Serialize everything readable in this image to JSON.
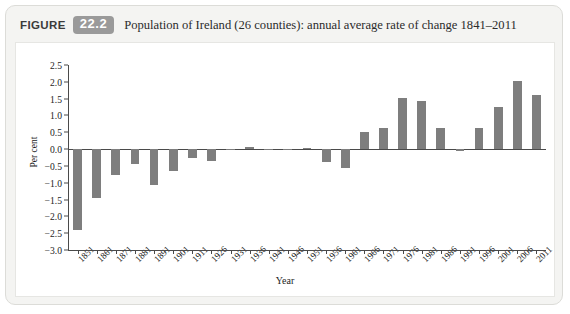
{
  "figure": {
    "label": "FIGURE",
    "number": "22.2",
    "title": "Population of Ireland (26 counties): annual average rate of change 1841–2011"
  },
  "chart_data": {
    "type": "bar",
    "title": "Population of Ireland (26 counties): annual average rate of change 1841–2011",
    "xlabel": "Year",
    "ylabel": "Per cent",
    "ylim": [
      -3.0,
      2.5
    ],
    "yticks": [
      "2.5",
      "2.0",
      "1.5",
      "1.0",
      "0.5",
      "0.0",
      "−0.5",
      "−1.0",
      "−1.5",
      "−2.0",
      "−2.5",
      "−3.0"
    ],
    "ytick_values": [
      2.5,
      2.0,
      1.5,
      1.0,
      0.5,
      0.0,
      -0.5,
      -1.0,
      -1.5,
      -2.0,
      -2.5,
      -3.0
    ],
    "grid": false,
    "legend": false,
    "bar_color": "#7e7e7e",
    "categories": [
      "1851",
      "1861",
      "1871",
      "1881",
      "1891",
      "1901",
      "1911",
      "1926",
      "1931",
      "1936",
      "1941",
      "1946",
      "1951",
      "1956",
      "1961",
      "1966",
      "1971",
      "1976",
      "1981",
      "1986",
      "1991",
      "1996",
      "2001",
      "2006",
      "2011"
    ],
    "values": [
      -2.4,
      -1.46,
      -0.77,
      -0.45,
      -1.06,
      -0.66,
      -0.28,
      -0.35,
      -0.04,
      0.06,
      -0.01,
      -0.04,
      0.03,
      -0.37,
      -0.55,
      0.52,
      0.63,
      1.53,
      1.44,
      0.63,
      -0.05,
      0.63,
      1.24,
      2.02,
      1.62
    ]
  }
}
